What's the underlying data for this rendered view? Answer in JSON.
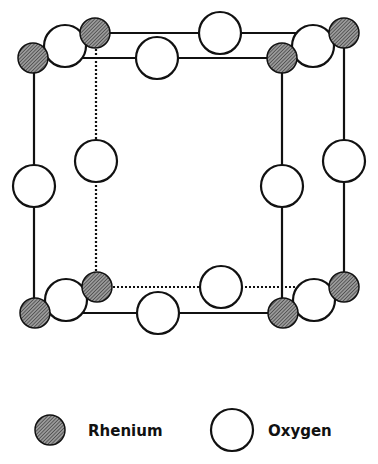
{
  "colors": {
    "stroke": "#111111",
    "rhenium_fill": "#7a7a7a",
    "oxygen_fill": "#ffffff",
    "background": "#ffffff"
  },
  "diagram": {
    "rhenium_radius": 15,
    "oxygen_radius": 21,
    "rhenium_atoms": [
      {
        "id": "re-front-top-left",
        "x": 33,
        "y": 58
      },
      {
        "id": "re-back-top-left",
        "x": 95,
        "y": 33
      },
      {
        "id": "re-front-top-right",
        "x": 282,
        "y": 58
      },
      {
        "id": "re-back-top-right",
        "x": 344,
        "y": 33
      },
      {
        "id": "re-front-bottom-left",
        "x": 35,
        "y": 313
      },
      {
        "id": "re-back-bottom-left",
        "x": 97,
        "y": 287
      },
      {
        "id": "re-front-bottom-right",
        "x": 283,
        "y": 313
      },
      {
        "id": "re-back-bottom-right",
        "x": 344,
        "y": 287
      }
    ],
    "oxygen_atoms": [
      {
        "id": "o-top-left-depth",
        "x": 65,
        "y": 46
      },
      {
        "id": "o-top-front-edge",
        "x": 157,
        "y": 58
      },
      {
        "id": "o-top-back-edge",
        "x": 220,
        "y": 33
      },
      {
        "id": "o-top-right-depth",
        "x": 313,
        "y": 46
      },
      {
        "id": "o-left-front-vertical",
        "x": 34,
        "y": 186
      },
      {
        "id": "o-left-back-vertical",
        "x": 96,
        "y": 161
      },
      {
        "id": "o-right-front-vertical",
        "x": 282,
        "y": 186
      },
      {
        "id": "o-right-back-vertical",
        "x": 344,
        "y": 161
      },
      {
        "id": "o-bottom-left-depth",
        "x": 66,
        "y": 300
      },
      {
        "id": "o-bottom-front-edge",
        "x": 158,
        "y": 313
      },
      {
        "id": "o-bottom-back-edge",
        "x": 221,
        "y": 287
      },
      {
        "id": "o-bottom-right-depth",
        "x": 314,
        "y": 300
      }
    ]
  },
  "legend": {
    "rhenium_label": "Rhenium",
    "oxygen_label": "Oxygen"
  }
}
